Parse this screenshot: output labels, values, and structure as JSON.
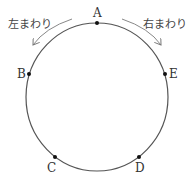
{
  "diagram": {
    "labels": {
      "left_rotation": "左まわり",
      "right_rotation": "右まわり"
    },
    "points": [
      {
        "name": "A",
        "x": 97,
        "y": 23
      },
      {
        "name": "B",
        "x": 29,
        "y": 74
      },
      {
        "name": "C",
        "x": 55,
        "y": 157
      },
      {
        "name": "D",
        "x": 139,
        "y": 157
      },
      {
        "name": "E",
        "x": 165,
        "y": 74
      }
    ],
    "colors": {
      "circle": "#555555",
      "arrow": "#777777",
      "point": "#111111"
    }
  }
}
